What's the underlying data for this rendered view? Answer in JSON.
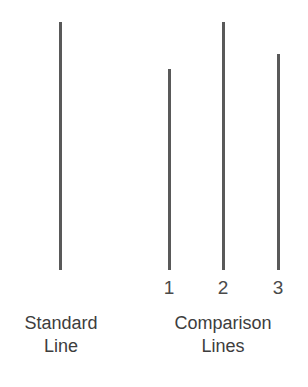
{
  "figure": {
    "width": 308,
    "height": 387,
    "background_color": "#ffffff",
    "line_color": "#595959",
    "text_color": "#3d3d3d",
    "baseline_y": 270
  },
  "standard": {
    "group_label_line1": "Standard",
    "group_label_line2": "Line",
    "line": {
      "name": "standard-line",
      "x": 59,
      "top": 22,
      "height": 248,
      "width": 3
    }
  },
  "comparison": {
    "group_label_line1": "Comparison",
    "group_label_line2": "Lines",
    "lines": [
      {
        "name": "comparison-line-1",
        "label": "1",
        "x": 168,
        "top": 69,
        "height": 201,
        "width": 3,
        "label_x": 154,
        "label_y": 278
      },
      {
        "name": "comparison-line-2",
        "label": "2",
        "x": 222,
        "top": 22,
        "height": 248,
        "width": 3,
        "label_x": 208,
        "label_y": 278
      },
      {
        "name": "comparison-line-3",
        "label": "3",
        "x": 277,
        "top": 54,
        "height": 216,
        "width": 3,
        "label_x": 263,
        "label_y": 278
      }
    ]
  },
  "chart_data": {
    "type": "bar",
    "orientation": "vertical-lines",
    "title": "",
    "xlabel": "",
    "ylabel": "",
    "categories": [
      "Standard Line",
      "1",
      "2",
      "3"
    ],
    "values": [
      248,
      201,
      248,
      216
    ],
    "units": "pixels",
    "grid": false,
    "legend": "none"
  }
}
